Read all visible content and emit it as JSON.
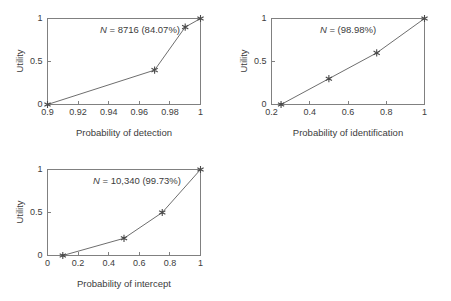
{
  "figure": {
    "background_color": "#ffffff",
    "axis_color": "#808080",
    "line_color": "#6e6e6e",
    "marker_color": "#4a4a4a",
    "text_color": "#3c3c3c",
    "marker_symbol": "six-pointed-star"
  },
  "chart_data": [
    {
      "type": "line",
      "panel": "top-left",
      "title": "",
      "annotation": "N = 8716 (84.07%)",
      "annotation_symbol": "N",
      "annotation_rest": " = 8716 (84.07%)",
      "sample_count": "8716",
      "percentage": "84.07%",
      "xlabel": "Probability of detection",
      "ylabel": "Utility",
      "x": [
        0.9,
        0.97,
        0.99,
        1.0
      ],
      "values": [
        0,
        0.4,
        0.9,
        1.0
      ],
      "xlim": [
        0.9,
        1.0
      ],
      "ylim": [
        0,
        1
      ],
      "xticks": [
        0.9,
        0.92,
        0.94,
        0.96,
        0.98,
        1
      ],
      "xticklabels": [
        "0.9",
        "0.92",
        "0.94",
        "0.96",
        "0.98",
        "1"
      ],
      "yticks": [
        0,
        0.5,
        1
      ],
      "yticklabels": [
        "0",
        "0.5",
        "1"
      ],
      "grid": false,
      "legend": "none"
    },
    {
      "type": "line",
      "panel": "top-right",
      "title": "",
      "annotation": "N = (98.98%)",
      "annotation_symbol": "N",
      "annotation_rest": " = (98.98%)",
      "sample_count": "",
      "percentage": "98.98%",
      "xlabel": "Probability of identification",
      "ylabel": "Utility",
      "x": [
        0.25,
        0.5,
        0.75,
        1.0
      ],
      "values": [
        0,
        0.3,
        0.6,
        1.0
      ],
      "xlim": [
        0.2,
        1.0
      ],
      "ylim": [
        0,
        1
      ],
      "xticks": [
        0.2,
        0.4,
        0.6,
        0.8,
        1
      ],
      "xticklabels": [
        "0.2",
        "0.4",
        "0.6",
        "0.8",
        "1"
      ],
      "yticks": [
        0,
        0.5,
        1
      ],
      "yticklabels": [
        "0",
        "0.5",
        "1"
      ],
      "grid": false,
      "legend": "none"
    },
    {
      "type": "line",
      "panel": "bottom-left",
      "title": "",
      "annotation": "N = 10,340 (99.73%)",
      "annotation_symbol": "N",
      "annotation_rest": " = 10,340 (99.73%)",
      "sample_count": "10,340",
      "percentage": "99.73%",
      "xlabel": "Probability of intercept",
      "ylabel": "Utility",
      "x": [
        0.1,
        0.5,
        0.75,
        1.0
      ],
      "values": [
        0,
        0.2,
        0.5,
        1.0
      ],
      "xlim": [
        0,
        1.0
      ],
      "ylim": [
        0,
        1
      ],
      "xticks": [
        0,
        0.2,
        0.4,
        0.6,
        0.8,
        1
      ],
      "xticklabels": [
        "0",
        "0.2",
        "0.4",
        "0.6",
        "0.8",
        "1"
      ],
      "yticks": [
        0,
        0.5,
        1
      ],
      "yticklabels": [
        "0",
        "0.5",
        "1"
      ],
      "grid": false,
      "legend": "none"
    }
  ]
}
